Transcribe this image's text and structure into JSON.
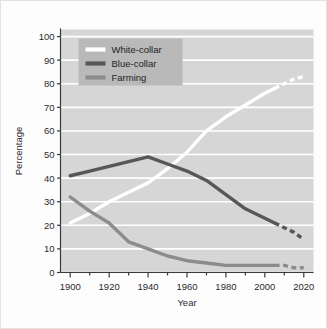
{
  "chart_data": {
    "type": "line",
    "title": "",
    "xlabel": "Year",
    "ylabel": "Percentage",
    "xlim": [
      1895,
      2025
    ],
    "ylim": [
      0,
      103
    ],
    "xticks": [
      1900,
      1920,
      1940,
      1960,
      1980,
      2000,
      2020
    ],
    "yticks": [
      0,
      10,
      20,
      30,
      40,
      50,
      60,
      70,
      80,
      90,
      100
    ],
    "xtick_labels": [
      "1900",
      "1920",
      "1940",
      "1960",
      "1980",
      "2000",
      "2020"
    ],
    "ytick_labels": [
      "0",
      "10",
      "20",
      "30",
      "40",
      "50",
      "60",
      "70",
      "80",
      "90",
      "100"
    ],
    "grid": "horizontal",
    "legend_position": "upper-left",
    "plot_background": "#d6d6d6",
    "gridline_color": "#ffffff",
    "series": [
      {
        "name": "White-collar",
        "color": "#ffffff",
        "solid_x": [
          1900,
          1910,
          1920,
          1930,
          1940,
          1950,
          1960,
          1970,
          1980,
          1990,
          2000,
          2005
        ],
        "solid_y": [
          21,
          25,
          30,
          34,
          38,
          44,
          51,
          60,
          66,
          71,
          76,
          78
        ],
        "dashed_x": [
          2005,
          2010,
          2015,
          2020
        ],
        "dashed_y": [
          78,
          80,
          82,
          83
        ]
      },
      {
        "name": "Blue-collar",
        "color": "#575757",
        "solid_x": [
          1900,
          1910,
          1920,
          1930,
          1940,
          1950,
          1960,
          1970,
          1980,
          1990,
          2000,
          2005
        ],
        "solid_y": [
          41,
          43,
          45,
          47,
          49,
          46,
          43,
          39,
          33,
          27,
          23,
          21
        ],
        "dashed_x": [
          2005,
          2010,
          2015,
          2020
        ],
        "dashed_y": [
          21,
          19,
          17,
          14
        ]
      },
      {
        "name": "Farming",
        "color": "#8c8c8c",
        "solid_x": [
          1900,
          1910,
          1920,
          1930,
          1940,
          1950,
          1960,
          1970,
          1980,
          1990,
          2000,
          2005
        ],
        "solid_y": [
          32,
          26,
          21,
          13,
          10,
          7,
          5,
          4,
          3,
          3,
          3,
          3
        ],
        "dashed_x": [
          2005,
          2010,
          2015,
          2020
        ],
        "dashed_y": [
          3,
          3,
          2,
          2
        ]
      }
    ],
    "legend": [
      {
        "label": "White-collar",
        "color": "#ffffff"
      },
      {
        "label": "Blue-collar",
        "color": "#575757"
      },
      {
        "label": "Farming",
        "color": "#8c8c8c"
      }
    ]
  }
}
